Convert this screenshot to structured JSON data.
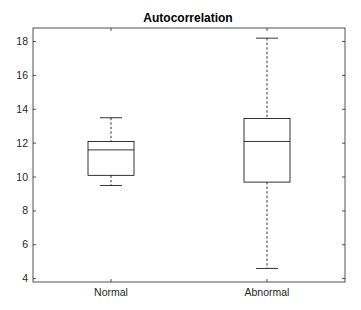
{
  "chart_data": {
    "type": "boxplot",
    "title": "Autocorrelation",
    "xlabel": "",
    "ylabel": "",
    "categories": [
      "Normal",
      "Abnormal"
    ],
    "ylim": [
      3.8,
      18.8
    ],
    "yticks": [
      4,
      6,
      8,
      10,
      12,
      14,
      16,
      18
    ],
    "grid": false,
    "legend": null,
    "series": [
      {
        "name": "Normal",
        "lower_whisker": 9.5,
        "q1": 10.1,
        "median": 11.6,
        "q3": 12.1,
        "upper_whisker": 13.5
      },
      {
        "name": "Abnormal",
        "lower_whisker": 4.6,
        "q1": 9.7,
        "median": 12.1,
        "q3": 13.45,
        "upper_whisker": 18.2
      }
    ]
  },
  "colors": {
    "axis": "#262626",
    "box": "#000000",
    "background": "#ffffff"
  }
}
